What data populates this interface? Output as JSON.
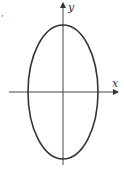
{
  "figure": {
    "type": "ellipse-on-axes",
    "stray_mark": ",",
    "axes": {
      "x_label": "x",
      "y_label": "y",
      "origin": [
        63,
        92
      ],
      "x_axis": {
        "from": 9,
        "to": 118
      },
      "y_axis": {
        "from": 165,
        "to": 2
      }
    },
    "ellipse": {
      "cx": 63,
      "cy": 92,
      "rx": 35,
      "ry": 67,
      "orientation": "vertical major axis"
    },
    "colors": {
      "stroke": "#333333",
      "axis": "#444444",
      "background": "#ffffff"
    }
  }
}
